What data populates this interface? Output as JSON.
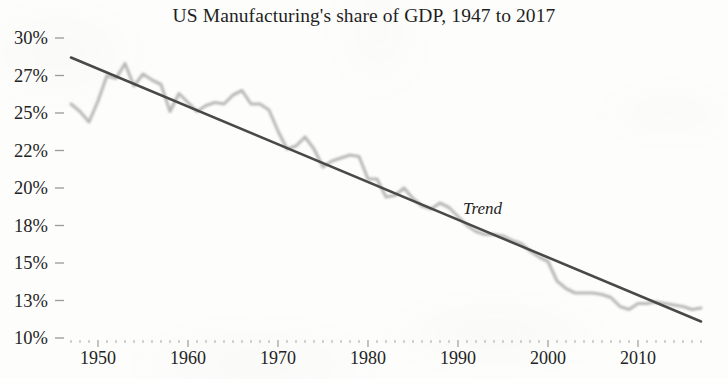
{
  "figure": {
    "title": "US Manufacturing's share of GDP, 1947 to 2017",
    "trend_label": "Trend",
    "background_color": "#fdfdfc",
    "series_color": "#b9b9b9",
    "trend_color": "#4a4a4a",
    "text_color": "#242424"
  },
  "axes": {
    "y_tick_labels": [
      "30%",
      "27%",
      "25%",
      "22%",
      "20%",
      "18%",
      "15%",
      "13%",
      "10%"
    ],
    "x_tick_labels": [
      "1950",
      "1960",
      "1970",
      "1980",
      "1990",
      "2000",
      "2010"
    ]
  },
  "chart_data": {
    "type": "line",
    "title": "US Manufacturing's share of GDP, 1947 to 2017",
    "xlabel": "",
    "ylabel": "",
    "xlim": [
      1947,
      2017
    ],
    "ylim": [
      10,
      30
    ],
    "grid": false,
    "legend": false,
    "y_tick_values": [
      30,
      27.5,
      25,
      22.5,
      20,
      17.5,
      15,
      12.5,
      10
    ],
    "y_tick_labels": [
      "30%",
      "27%",
      "25%",
      "22%",
      "20%",
      "18%",
      "15%",
      "13%",
      "10%"
    ],
    "x_tick_values": [
      1950,
      1960,
      1970,
      1980,
      1990,
      2000,
      2010
    ],
    "x_tick_labels": [
      "1950",
      "1960",
      "1970",
      "1980",
      "1990",
      "2000",
      "2010"
    ],
    "x_minor_tick_interval": 1,
    "annotations": [
      {
        "text": "Trend",
        "x": 1993,
        "y": 18.6,
        "style": "italic"
      }
    ],
    "series": [
      {
        "name": "Manufacturing share of GDP",
        "type": "line",
        "color": "#b9b9b9",
        "x": [
          1947,
          1948,
          1949,
          1950,
          1951,
          1952,
          1953,
          1954,
          1955,
          1956,
          1957,
          1958,
          1959,
          1960,
          1961,
          1962,
          1963,
          1964,
          1965,
          1966,
          1967,
          1968,
          1969,
          1970,
          1971,
          1972,
          1973,
          1974,
          1975,
          1976,
          1977,
          1978,
          1979,
          1980,
          1981,
          1982,
          1983,
          1984,
          1985,
          1986,
          1987,
          1988,
          1989,
          1990,
          1991,
          1992,
          1993,
          1994,
          1995,
          1996,
          1997,
          1998,
          1999,
          2000,
          2001,
          2002,
          2003,
          2004,
          2005,
          2006,
          2007,
          2008,
          2009,
          2010,
          2011,
          2012,
          2013,
          2014,
          2015,
          2016,
          2017
        ],
        "y": [
          25.6,
          25.1,
          24.4,
          25.8,
          27.5,
          27.3,
          28.3,
          26.8,
          27.6,
          27.2,
          26.9,
          25.1,
          26.3,
          25.7,
          25.1,
          25.5,
          25.7,
          25.6,
          26.2,
          26.5,
          25.6,
          25.6,
          25.2,
          23.8,
          22.6,
          22.8,
          23.4,
          22.6,
          21.4,
          21.8,
          22.0,
          22.2,
          22.1,
          20.6,
          20.6,
          19.4,
          19.5,
          20.0,
          19.3,
          18.8,
          18.6,
          19.0,
          18.7,
          18.1,
          17.5,
          17.1,
          16.9,
          16.9,
          16.8,
          16.5,
          16.3,
          15.8,
          15.4,
          15.1,
          13.8,
          13.3,
          13.0,
          13.0,
          13.0,
          12.9,
          12.7,
          12.1,
          11.9,
          12.3,
          12.3,
          12.4,
          12.3,
          12.2,
          12.1,
          11.9,
          12.0
        ]
      },
      {
        "name": "Trend",
        "type": "line",
        "color": "#4a4a4a",
        "x": [
          1947,
          2017
        ],
        "y": [
          28.7,
          11.1
        ]
      }
    ]
  }
}
